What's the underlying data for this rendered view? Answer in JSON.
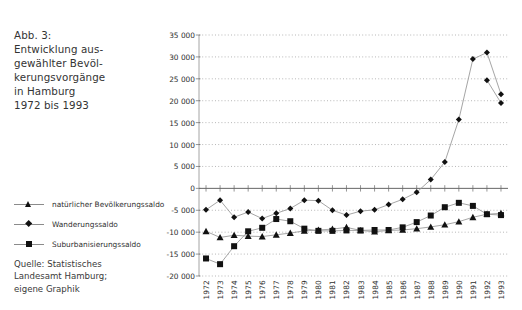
{
  "caption": {
    "lines": [
      "Abb. 3:",
      "Entwicklung aus-",
      "gewählter Bevöl-",
      "kerungsvorgänge",
      "in Hamburg",
      "1972 bis 1993"
    ]
  },
  "source": {
    "lines": [
      "Quelle: Statistisches",
      "Landesamt Hamburg;",
      "eigene Graphik"
    ]
  },
  "legend": [
    {
      "label": "natürlicher Bevölkerungssaldo",
      "marker": "triangle",
      "color": "#111111"
    },
    {
      "label": "Wanderungssaldo",
      "marker": "diamond",
      "color": "#111111"
    },
    {
      "label": "Suburbanisierungssaldo",
      "marker": "square",
      "color": "#111111"
    }
  ],
  "chart_data": {
    "type": "line",
    "xlabel": "",
    "ylabel": "",
    "x": [
      1972,
      1973,
      1974,
      1975,
      1976,
      1977,
      1978,
      1979,
      1980,
      1981,
      1982,
      1983,
      1984,
      1985,
      1986,
      1987,
      1988,
      1989,
      1990,
      1991,
      1992,
      1993
    ],
    "xtick_labels": [
      "1972",
      "1973",
      "1974",
      "1975",
      "1976",
      "1977",
      "1978",
      "1979",
      "1980",
      "1981",
      "1982",
      "1983",
      "1984",
      "1985",
      "1986",
      "1987",
      "1988",
      "1989",
      "1990",
      "1991",
      "1992",
      "1993"
    ],
    "ytick_labels": [
      "35 000",
      "30 000",
      "25 000",
      "20 000",
      "15 000",
      "10 000",
      "5 000",
      "0",
      "-5 000",
      "-10 000",
      "-15 000",
      "-20 000"
    ],
    "ytick_values": [
      35000,
      30000,
      25000,
      20000,
      15000,
      10000,
      5000,
      0,
      -5000,
      -10000,
      -15000,
      -20000
    ],
    "ylim": [
      -20000,
      35000
    ],
    "grid": true,
    "legend_position": "left-outside",
    "series": [
      {
        "name": "natürlicher Bevölkerungssaldo",
        "marker": "triangle",
        "color": "#111111",
        "values": [
          -9800,
          -11200,
          -10700,
          -10900,
          -11000,
          -10600,
          -10200,
          -9700,
          -9500,
          -9300,
          -8900,
          -9600,
          -9900,
          -9600,
          -9500,
          -9200,
          -8800,
          -8300,
          -7600,
          -6600,
          -5900,
          -5700
        ]
      },
      {
        "name": "Wanderungssaldo",
        "marker": "diamond",
        "color": "#111111",
        "values": [
          -4900,
          -2700,
          -6600,
          -5400,
          -6900,
          -5700,
          -4600,
          -2700,
          -2800,
          -5000,
          -6100,
          -5200,
          -4900,
          -3700,
          -2500,
          -900,
          2000,
          6000,
          15700,
          29500,
          31000,
          21500
        ]
      },
      {
        "name": "Suburbanisierungssaldo",
        "marker": "square",
        "color": "#111111",
        "values": [
          -16000,
          -17300,
          -13200,
          -9800,
          -9000,
          -7000,
          -7500,
          -9200,
          -9700,
          -9700,
          -9600,
          -9600,
          -9500,
          -9500,
          -8900,
          -7700,
          -6200,
          -4300,
          -3300,
          -4000,
          -5900,
          -6100
        ]
      },
      {
        "name": "Wanderungssaldo-continued",
        "marker": "diamond",
        "color": "#111111",
        "values": [
          null,
          null,
          null,
          null,
          null,
          null,
          null,
          null,
          null,
          null,
          null,
          null,
          null,
          null,
          null,
          null,
          null,
          null,
          null,
          null,
          24700,
          19500
        ]
      }
    ]
  }
}
